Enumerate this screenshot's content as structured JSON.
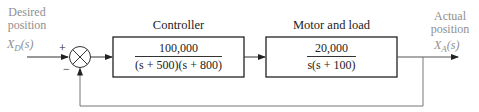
{
  "diagram": {
    "type": "block-diagram",
    "input": {
      "label_line1": "Desired",
      "label_line2": "position",
      "signal": "X_D(s)",
      "signal_main": "X",
      "signal_sub": "D",
      "signal_arg": "(s)"
    },
    "summing_junction": {
      "plus_sign": "+",
      "minus_sign": "−"
    },
    "controller": {
      "label": "Controller",
      "numerator": "100,000",
      "denominator": "(s + 500)(s + 800)"
    },
    "plant": {
      "label": "Motor and load",
      "numerator": "20,000",
      "denominator": "s(s + 100)"
    },
    "output": {
      "label_line1": "Actual",
      "label_line2": "position",
      "signal": "X_A(s)",
      "signal_main": "X",
      "signal_sub": "A",
      "signal_arg": "(s)"
    },
    "feedback": "unity negative feedback",
    "colors": {
      "line": "#333333",
      "feedback_line": "#777777",
      "signal_label": "#8f8f8f"
    }
  }
}
